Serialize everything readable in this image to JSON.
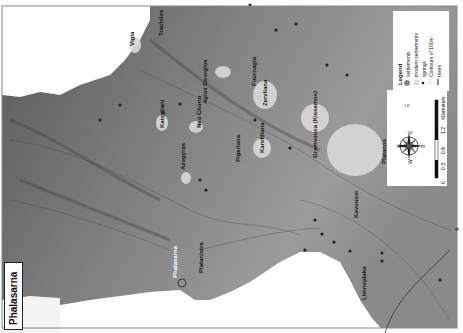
{
  "map": {
    "title": "Phalasarna",
    "orientation": "rotated 90deg clockwise",
    "legend": {
      "heading": "Legend",
      "items": [
        {
          "symbol": "grey circle",
          "label": "settlements"
        },
        {
          "symbol": "light polygon",
          "label": "modern settlements"
        },
        {
          "symbol": "black dot",
          "label": "springs"
        },
        {
          "symbol": "thin line",
          "label": "Contours of 100m"
        },
        {
          "symbol": "thick line",
          "label": "rivers"
        }
      ]
    },
    "scale": {
      "unit": "Kilometers",
      "ticks": [
        "0",
        "0.3",
        "0.6",
        "1.2"
      ]
    },
    "compass": {
      "labels": [
        "N",
        "E",
        "S",
        "W"
      ]
    },
    "places": [
      {
        "name": "Vigla",
        "x": 131,
        "y": 38
      },
      {
        "name": "Trachilos",
        "x": 160,
        "y": 24
      },
      {
        "name": "Katsyliani",
        "x": 160,
        "y": 124
      },
      {
        "name": "Neo Chorio",
        "x": 198,
        "y": 125
      },
      {
        "name": "Agios Georgios",
        "x": 213,
        "y": 98
      },
      {
        "name": "Fournagia",
        "x": 263,
        "y": 68
      },
      {
        "name": "Zervliana",
        "x": 271,
        "y": 100
      },
      {
        "name": "Karefiliana",
        "x": 263,
        "y": 150
      },
      {
        "name": "Pigerlana",
        "x": 191,
        "y": 172
      },
      {
        "name": "Azogyras",
        "x": 186,
        "y": 166
      },
      {
        "name": "Gramvousa (Kissamos)",
        "x": 318,
        "y": 156
      },
      {
        "name": "Platanos",
        "x": 390,
        "y": 160
      },
      {
        "name": "Kavousoi",
        "x": 330,
        "y": 236
      },
      {
        "name": "Phalasarna",
        "x": 175,
        "y": 277
      },
      {
        "name": "Platanistra",
        "x": 200,
        "y": 276
      },
      {
        "name": "Limnoplaka",
        "x": 366,
        "y": 290
      }
    ]
  }
}
